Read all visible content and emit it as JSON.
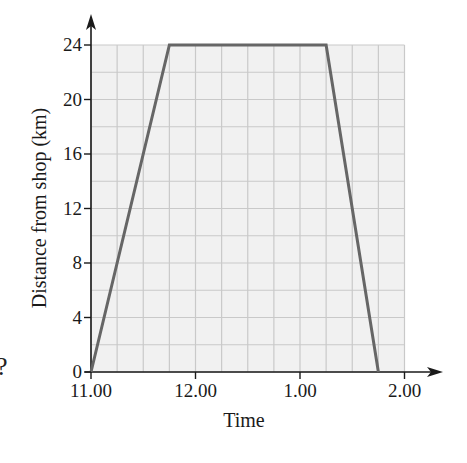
{
  "chart_data": {
    "type": "line",
    "title": "",
    "xlabel": "Time",
    "ylabel": "Distance from shop (km)",
    "x_tick_labels": [
      "11.00",
      "12.00",
      "1.00",
      "2.00"
    ],
    "y_tick_labels": [
      "0",
      "4",
      "8",
      "12",
      "16",
      "20",
      "24"
    ],
    "xlim": [
      "11.00",
      "2.00"
    ],
    "ylim": [
      0,
      24
    ],
    "grid": true,
    "grid_minor": {
      "x_step": "15 min",
      "y_step": 2
    },
    "series": [
      {
        "name": "Distance from shop",
        "color": "#666666",
        "points": [
          {
            "x": "11.00",
            "y": 0
          },
          {
            "x": "11.45",
            "y": 24
          },
          {
            "x": "1.15",
            "y": 24
          },
          {
            "x": "1.45",
            "y": 0
          }
        ]
      }
    ],
    "x_hours_from_11": [
      0,
      0.75,
      2.25,
      2.75
    ],
    "values": [
      0,
      24,
      24,
      0
    ]
  },
  "labels": {
    "xlabel": "Time",
    "ylabel": "Distance from shop (km)",
    "stray_glyph": "?"
  },
  "colors": {
    "grid_bg": "#f1f1f1",
    "grid_line": "#c9c9c9",
    "axis": "#1a1a1a",
    "series": "#666666"
  }
}
